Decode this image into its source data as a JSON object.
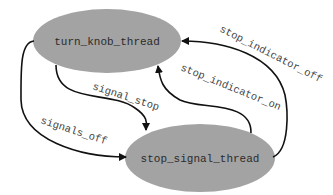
{
  "diagram": {
    "type": "state-diagram",
    "colors": {
      "node_fill": "#a3a3a3",
      "node_text": "#2b2b2b",
      "edge": "#111111",
      "edge_text": "#444444",
      "background": "#ffffff"
    },
    "nodes": [
      {
        "id": "turn_knob_thread",
        "label": "turn_knob_thread"
      },
      {
        "id": "stop_signal_thread",
        "label": "stop_signal_thread"
      }
    ],
    "edges": [
      {
        "from": "turn_knob_thread",
        "to": "stop_signal_thread",
        "label": "signal_stop"
      },
      {
        "from": "turn_knob_thread",
        "to": "stop_signal_thread",
        "label": "signals_off"
      },
      {
        "from": "stop_signal_thread",
        "to": "turn_knob_thread",
        "label": "stop_indicator_on"
      },
      {
        "from": "stop_signal_thread",
        "to": "turn_knob_thread",
        "label": "stop_indicator_off"
      }
    ]
  }
}
